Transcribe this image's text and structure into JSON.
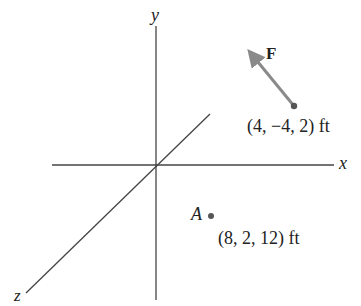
{
  "diagram": {
    "axes": {
      "x_label": "x",
      "y_label": "y",
      "z_label": "z"
    },
    "force": {
      "label": "F",
      "tail_point": "(4, −4, 2) ft",
      "color": "#808080"
    },
    "point_a": {
      "label": "A",
      "coords": "(8, 2, 12) ft"
    },
    "colors": {
      "axis": "#444444",
      "text": "#222222",
      "dot": "#555555"
    }
  }
}
